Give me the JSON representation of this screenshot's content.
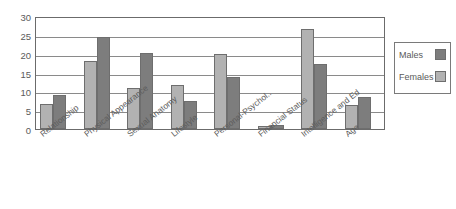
{
  "chart_data": {
    "type": "bar",
    "title": "",
    "subtitle": "",
    "xlabel": "",
    "ylabel": "",
    "ylim": [
      0,
      30
    ],
    "yticks": [
      0,
      5,
      10,
      15,
      20,
      25,
      30
    ],
    "grid": true,
    "legend_position": "right",
    "categories": [
      "Relationship",
      "Physical Appearance",
      "Sexual Anatomy",
      "Lifestyle",
      "Personal-Psychol..",
      "Financial Status",
      "Intelligence and Ed",
      "Age"
    ],
    "series": [
      {
        "name": "Females",
        "color": "#b2b2b2",
        "values": [
          6.8,
          18.5,
          11.0,
          11.8,
          20.3,
          0.7,
          27.0,
          6.5
        ]
      },
      {
        "name": "Males",
        "color": "#7d7d7d",
        "values": [
          9.1,
          25.0,
          20.6,
          7.6,
          14.0,
          1.2,
          17.7,
          8.7
        ]
      }
    ]
  },
  "legend": {
    "entries": [
      {
        "label": "Males",
        "swatch": "male"
      },
      {
        "label": "Females",
        "swatch": "female"
      }
    ]
  },
  "axis": {
    "y_tick_labels": [
      "30",
      "25",
      "20",
      "15",
      "10",
      "5",
      "0"
    ]
  },
  "colors": {
    "males": "#7d7d7d",
    "females": "#b2b2b2",
    "axis": "#6b6b6b",
    "grid": "#8a8a8a",
    "text": "#5a5a5a",
    "background": "#ffffff"
  }
}
